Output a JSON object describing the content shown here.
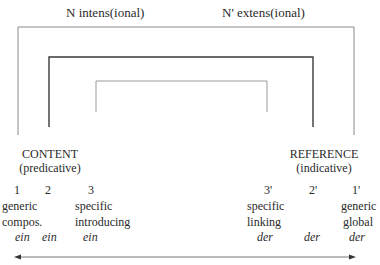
{
  "header": {
    "left_label": "N intens(ional)",
    "right_label": "N' extens(ional)"
  },
  "poles": {
    "content": {
      "title": "CONTENT",
      "subtitle": "(predicative)"
    },
    "reference": {
      "title": "REFERENCE",
      "subtitle": "(indicative)"
    }
  },
  "columns": [
    {
      "number": "1",
      "line1": "generic",
      "line2": "compos.",
      "article": "ein"
    },
    {
      "number": "2",
      "line1": "",
      "line2": "",
      "article": "ein"
    },
    {
      "number": "3",
      "line1": "specific",
      "line2": "introducing",
      "article": "ein"
    },
    {
      "number": "3'",
      "line1": "specific",
      "line2": "linking",
      "article": "der"
    },
    {
      "number": "2'",
      "line1": "",
      "line2": "",
      "article": "der"
    },
    {
      "number": "1'",
      "line1": "generic",
      "line2": "global",
      "article": "der"
    }
  ],
  "brackets": [
    {
      "name": "outer",
      "stroke": "#8a8a8a"
    },
    {
      "name": "middle",
      "stroke": "#3a3a3a"
    },
    {
      "name": "inner",
      "stroke": "#9a9a9a"
    }
  ],
  "axis": {
    "type": "double-arrow"
  }
}
